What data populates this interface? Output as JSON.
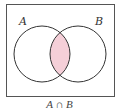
{
  "diagram": {
    "type": "venn",
    "sets": [
      {
        "name": "A",
        "label": "A"
      },
      {
        "name": "B",
        "label": "B"
      }
    ],
    "shaded_region": "A ∩ B",
    "caption": "A ∩ B",
    "colors": {
      "shade": "#f5cfd8",
      "stroke": "#333333",
      "frame": "#555555"
    }
  }
}
